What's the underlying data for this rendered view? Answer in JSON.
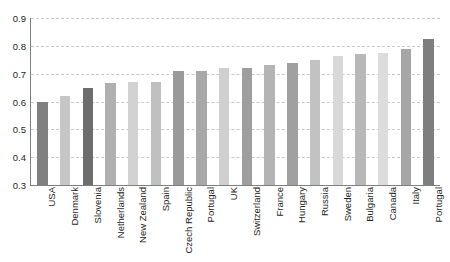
{
  "chart_data": {
    "type": "bar",
    "title": "",
    "subtitle": "",
    "xlabel": "",
    "ylabel": "",
    "ylim": [
      0.3,
      0.9
    ],
    "yticks": [
      "0.3",
      "0.4",
      "0.5",
      "0.6",
      "0.7",
      "0.8",
      "0.9"
    ],
    "ytick_values": [
      0.3,
      0.4,
      0.5,
      0.6,
      0.7,
      0.8,
      0.9
    ],
    "grid": "horizontal-dashed",
    "legend": "none",
    "categories": [
      "USA",
      "Denmark",
      "Slovenia",
      "Netherlands",
      "New Zealand",
      "Spain",
      "Czech Republic",
      "Portugal",
      "UK",
      "Switzerland",
      "France",
      "Hungary",
      "Russia",
      "Sweden",
      "Bulgaria",
      "Canada",
      "Italy",
      "Portugal"
    ],
    "values": [
      0.6,
      0.62,
      0.65,
      0.665,
      0.67,
      0.67,
      0.71,
      0.71,
      0.72,
      0.72,
      0.73,
      0.74,
      0.75,
      0.765,
      0.77,
      0.775,
      0.79,
      0.825
    ],
    "bar_colors": [
      "#808080",
      "#c6c6c6",
      "#6d6d6d",
      "#b0b0b0",
      "#d2d2d2",
      "#c0c0c0",
      "#9a9a9a",
      "#a8a8a8",
      "#cfcfcf",
      "#9e9e9e",
      "#b4b4b4",
      "#a0a0a0",
      "#c2c2c2",
      "#d8d8d8",
      "#b8b8b8",
      "#dcdcdc",
      "#a6a6a6",
      "#7e7e7e"
    ],
    "axis_color": "#808080",
    "grid_color": "#c9c9c9",
    "text_color": "#231f20"
  }
}
